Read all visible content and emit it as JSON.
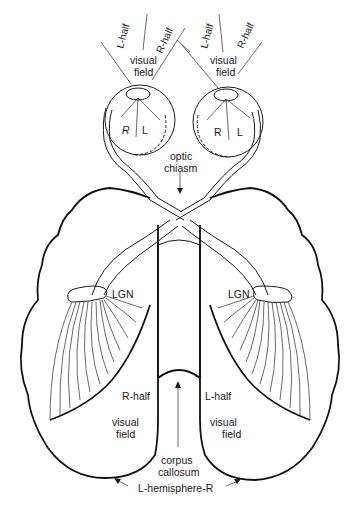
{
  "diagram": {
    "type": "anatomical-line-drawing",
    "colors": {
      "ink": "#1a1a1a",
      "background": "#ffffff"
    },
    "left_eye": {
      "field_labels": {
        "left": "L-half",
        "right": "R-half",
        "center": "visual",
        "center2": "field"
      },
      "retina_labels": {
        "left": "R",
        "right": "L"
      }
    },
    "right_eye": {
      "field_labels": {
        "left": "L-half",
        "right": "R-half",
        "center": "visual",
        "center2": "field"
      },
      "retina_labels": {
        "left": "R",
        "right": "L"
      }
    },
    "chiasm": {
      "line1": "optic",
      "line2": "chiasm"
    },
    "left_hemisphere": {
      "lgn": "LGN",
      "field_line1": "R-half",
      "field_line2": "visual",
      "field_line3": "field"
    },
    "right_hemisphere": {
      "lgn": "LGN",
      "field_line1": "L-half",
      "field_line2": "visual",
      "field_line3": "field"
    },
    "corpus_callosum": {
      "line1": "corpus",
      "line2": "callosum"
    },
    "hemisphere_label": "L-hemisphere-R"
  }
}
